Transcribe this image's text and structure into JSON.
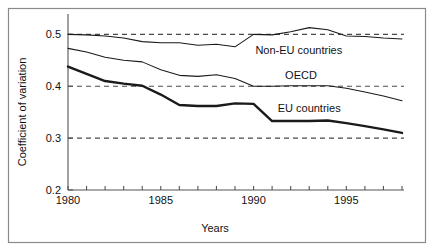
{
  "figure": {
    "name": "coefficient-of-variation-line-chart",
    "border_color": "#8a8a8a",
    "background": "#ffffff"
  },
  "chart_data": {
    "type": "line",
    "title": "",
    "xlabel": "Years",
    "ylabel": "Coefficient of variation",
    "xlim": [
      1980,
      1998
    ],
    "ylim": [
      0.2,
      0.52
    ],
    "xticks": [
      1980,
      1981,
      1982,
      1983,
      1984,
      1985,
      1986,
      1987,
      1988,
      1989,
      1990,
      1991,
      1992,
      1993,
      1994,
      1995,
      1996,
      1997,
      1998
    ],
    "xtick_labels": [
      "1980",
      "",
      "",
      "",
      "",
      "1985",
      "",
      "",
      "",
      "",
      "1990",
      "",
      "",
      "",
      "",
      "1995",
      "",
      "",
      ""
    ],
    "yticks": [
      0.2,
      0.3,
      0.4,
      0.5
    ],
    "ytick_labels": [
      "0.2",
      "0.3",
      "0.4",
      "0.5"
    ],
    "grid": "horizontal-dashed at 0.3, 0.4, 0.5",
    "legend_position": "inline-annotations",
    "x": [
      1980,
      1981,
      1982,
      1983,
      1984,
      1985,
      1986,
      1987,
      1988,
      1989,
      1990,
      1991,
      1992,
      1993,
      1994,
      1995,
      1996,
      1997,
      1998
    ],
    "series": [
      {
        "name": "Non-EU countries",
        "label": "Non-EU countries",
        "style": "thin",
        "color": "#1a1a1a",
        "values": [
          0.5,
          0.499,
          0.497,
          0.493,
          0.486,
          0.484,
          0.484,
          0.479,
          0.481,
          0.476,
          0.5,
          0.499,
          0.505,
          0.513,
          0.509,
          0.497,
          0.496,
          0.493,
          0.491
        ]
      },
      {
        "name": "OECD",
        "label": "OECD",
        "style": "thin",
        "color": "#1a1a1a",
        "values": [
          0.473,
          0.466,
          0.456,
          0.45,
          0.447,
          0.432,
          0.421,
          0.419,
          0.422,
          0.415,
          0.4,
          0.4,
          0.401,
          0.401,
          0.401,
          0.396,
          0.389,
          0.381,
          0.372
        ]
      },
      {
        "name": "EU countries",
        "label": "EU countries",
        "style": "thick",
        "color": "#1a1a1a",
        "values": [
          0.438,
          0.424,
          0.41,
          0.405,
          0.401,
          0.384,
          0.364,
          0.362,
          0.362,
          0.367,
          0.366,
          0.333,
          0.333,
          0.333,
          0.334,
          0.329,
          0.323,
          0.317,
          0.31
        ]
      }
    ],
    "annotations": [
      {
        "text": "Non-EU countries",
        "x": 1990.1,
        "y": 0.462
      },
      {
        "text": "OECD",
        "x": 1991.7,
        "y": 0.414
      },
      {
        "text": "EU countries",
        "x": 1991.3,
        "y": 0.35
      }
    ]
  }
}
